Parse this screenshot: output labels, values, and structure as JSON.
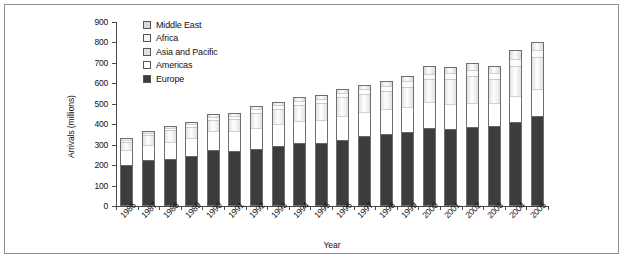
{
  "chart_data": {
    "type": "bar",
    "subtype": "stacked-bar",
    "title": "",
    "xlabel": "Year",
    "ylabel": "Arrivals (millions)",
    "ylim": [
      0,
      900
    ],
    "ytick_step": 100,
    "yticks": [
      0,
      100,
      200,
      300,
      400,
      500,
      600,
      700,
      800,
      900
    ],
    "grid": false,
    "legend_position": "top-left-inside",
    "categories": [
      "1986",
      "1987",
      "1988",
      "1989",
      "1990",
      "1991",
      "1992",
      "1993",
      "1994",
      "1995",
      "1996",
      "1997",
      "1998",
      "1999",
      "2000",
      "2001",
      "2002",
      "2003",
      "2004",
      "2005"
    ],
    "series": [
      {
        "name": "Europe",
        "color": "#3d3d3d",
        "values": [
          208,
          228,
          234,
          253,
          277,
          275,
          286,
          295,
          310,
          317,
          328,
          348,
          360,
          367,
          386,
          384,
          394,
          396,
          417,
          441
        ]
      },
      {
        "name": "Americas",
        "color": "#ffffff",
        "values": [
          71,
          76,
          82,
          87,
          93,
          96,
          102,
          107,
          107,
          109,
          116,
          117,
          119,
          122,
          128,
          122,
          117,
          113,
          126,
          133
        ]
      },
      {
        "name": "Asia and Pacific",
        "color": "#e2e2e2",
        "values": [
          41,
          47,
          58,
          54,
          57,
          61,
          71,
          75,
          82,
          85,
          92,
          89,
          89,
          98,
          110,
          121,
          131,
          119,
          145,
          156
        ]
      },
      {
        "name": "Africa",
        "color": "#f7f7f7",
        "values": [
          9,
          10,
          11,
          12,
          15,
          16,
          18,
          18,
          19,
          20,
          22,
          24,
          26,
          27,
          28,
          29,
          30,
          31,
          34,
          37
        ]
      },
      {
        "name": "Middle East",
        "color": "#d9d9d9",
        "values": [
          4,
          5,
          6,
          7,
          8,
          8,
          12,
          12,
          13,
          14,
          13,
          16,
          19,
          22,
          32,
          24,
          28,
          27,
          41,
          33
        ]
      }
    ],
    "totals": [
      333,
      366,
      391,
      413,
      450,
      456,
      489,
      507,
      531,
      545,
      571,
      594,
      613,
      636,
      684,
      680,
      700,
      686,
      763,
      800
    ]
  },
  "legend": {
    "entries": [
      {
        "label": "Middle East",
        "color": "#d9d9d9"
      },
      {
        "label": "Africa",
        "color": "#f7f7f7"
      },
      {
        "label": "Asia and Pacific",
        "color": "#e2e2e2"
      },
      {
        "label": "Americas",
        "color": "#ffffff"
      },
      {
        "label": "Europe",
        "color": "#3d3d3d"
      }
    ]
  },
  "axes": {
    "y_title": "Arrivals (millions)",
    "x_title": "Year"
  },
  "colors": {
    "axis": "#4a4a4a",
    "bar_outline": "#6f6f6f",
    "frame": "#8d8d8d",
    "text": "#111111"
  }
}
